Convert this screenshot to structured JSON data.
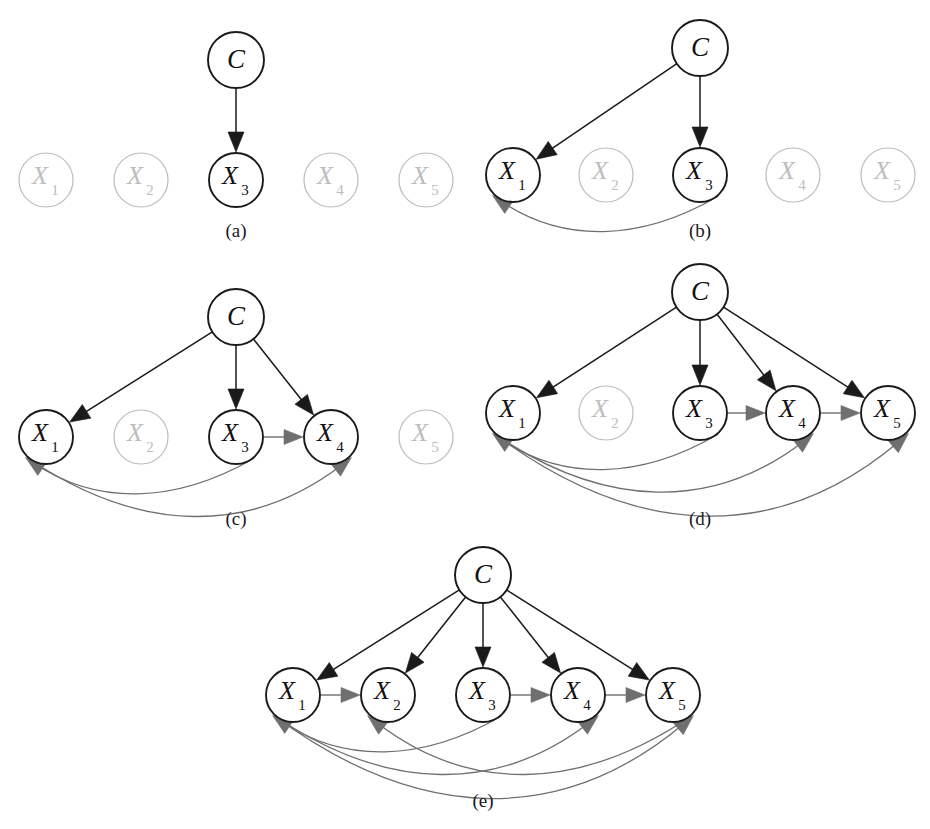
{
  "figure": {
    "title": "",
    "node_labels": {
      "c": "C",
      "x1": "X",
      "x1_sub": "1",
      "x2": "X",
      "x2_sub": "2",
      "x3": "X",
      "x3_sub": "3",
      "x4": "X",
      "x4_sub": "4",
      "x5": "X",
      "x5_sub": "5"
    },
    "colors": {
      "active_stroke": "#1a1a1a",
      "active_text": "#111111",
      "faded_stroke": "#bdbdbd",
      "faded_text": "#bdbdbd",
      "class_edge": "#1a1a1a",
      "feature_edge": "#6f6f6f",
      "background": "#ffffff"
    },
    "panels": [
      {
        "id": "a",
        "caption": "(a)",
        "caption_x": 236,
        "caption_y": 220,
        "class_node": {
          "name": "C",
          "x": 236,
          "y": 60,
          "r": 28
        },
        "feature_row_y": 180,
        "feature_radius": 27,
        "features": [
          {
            "name": "X1",
            "x": 46,
            "active": false
          },
          {
            "name": "X2",
            "x": 141,
            "active": false
          },
          {
            "name": "X3",
            "x": 236,
            "active": true
          },
          {
            "name": "X4",
            "x": 331,
            "active": false
          },
          {
            "name": "X5",
            "x": 426,
            "active": false
          }
        ],
        "class_edges": [
          "X3"
        ],
        "feature_edges": []
      },
      {
        "id": "b",
        "caption": "(b)",
        "caption_x": 700,
        "caption_y": 220,
        "class_node": {
          "name": "C",
          "x": 700,
          "y": 48,
          "r": 28
        },
        "feature_row_y": 175,
        "feature_radius": 27,
        "features": [
          {
            "name": "X1",
            "x": 513,
            "active": true
          },
          {
            "name": "X2",
            "x": 606,
            "active": false
          },
          {
            "name": "X3",
            "x": 700,
            "active": true
          },
          {
            "name": "X4",
            "x": 793,
            "active": false
          },
          {
            "name": "X5",
            "x": 888,
            "active": false
          }
        ],
        "class_edges": [
          "X1",
          "X3"
        ],
        "feature_edges": [
          {
            "from": "X3",
            "to": "X1",
            "depth": 1
          }
        ]
      },
      {
        "id": "c",
        "caption": "(c)",
        "caption_x": 236,
        "caption_y": 508,
        "class_node": {
          "name": "C",
          "x": 236,
          "y": 317,
          "r": 28
        },
        "feature_row_y": 437,
        "feature_radius": 27,
        "features": [
          {
            "name": "X1",
            "x": 46,
            "active": true
          },
          {
            "name": "X2",
            "x": 141,
            "active": false
          },
          {
            "name": "X3",
            "x": 236,
            "active": true
          },
          {
            "name": "X4",
            "x": 331,
            "active": true
          },
          {
            "name": "X5",
            "x": 426,
            "active": false
          }
        ],
        "class_edges": [
          "X1",
          "X3",
          "X4"
        ],
        "feature_edges": [
          {
            "from": "X3",
            "to": "X4",
            "depth": 0
          },
          {
            "from": "X3",
            "to": "X1",
            "depth": 1
          },
          {
            "from": "X1",
            "to": "X4",
            "depth": 2
          }
        ]
      },
      {
        "id": "d",
        "caption": "(d)",
        "caption_x": 700,
        "caption_y": 508,
        "class_node": {
          "name": "C",
          "x": 700,
          "y": 292,
          "r": 28
        },
        "feature_row_y": 413,
        "feature_radius": 27,
        "features": [
          {
            "name": "X1",
            "x": 513,
            "active": true
          },
          {
            "name": "X2",
            "x": 606,
            "active": false
          },
          {
            "name": "X3",
            "x": 700,
            "active": true
          },
          {
            "name": "X4",
            "x": 793,
            "active": true
          },
          {
            "name": "X5",
            "x": 888,
            "active": true
          }
        ],
        "class_edges": [
          "X1",
          "X3",
          "X4",
          "X5"
        ],
        "feature_edges": [
          {
            "from": "X3",
            "to": "X4",
            "depth": 0
          },
          {
            "from": "X4",
            "to": "X5",
            "depth": 0
          },
          {
            "from": "X3",
            "to": "X1",
            "depth": 1
          },
          {
            "from": "X1",
            "to": "X4",
            "depth": 2
          },
          {
            "from": "X1",
            "to": "X5",
            "depth": 3
          }
        ]
      },
      {
        "id": "e",
        "caption": "(e)",
        "caption_x": 483,
        "caption_y": 790,
        "class_node": {
          "name": "C",
          "x": 483,
          "y": 575,
          "r": 28
        },
        "feature_row_y": 695,
        "feature_radius": 27,
        "features": [
          {
            "name": "X1",
            "x": 293,
            "active": true
          },
          {
            "name": "X2",
            "x": 388,
            "active": true
          },
          {
            "name": "X3",
            "x": 483,
            "active": true
          },
          {
            "name": "X4",
            "x": 578,
            "active": true
          },
          {
            "name": "X5",
            "x": 673,
            "active": true
          }
        ],
        "class_edges": [
          "X1",
          "X2",
          "X3",
          "X4",
          "X5"
        ],
        "feature_edges": [
          {
            "from": "X1",
            "to": "X2",
            "depth": 0
          },
          {
            "from": "X3",
            "to": "X4",
            "depth": 0
          },
          {
            "from": "X4",
            "to": "X5",
            "depth": 0
          },
          {
            "from": "X3",
            "to": "X1",
            "depth": 1
          },
          {
            "from": "X5",
            "to": "X2",
            "depth": 2
          },
          {
            "from": "X1",
            "to": "X4",
            "depth": 2
          },
          {
            "from": "X1",
            "to": "X5",
            "depth": 3
          }
        ]
      }
    ]
  }
}
